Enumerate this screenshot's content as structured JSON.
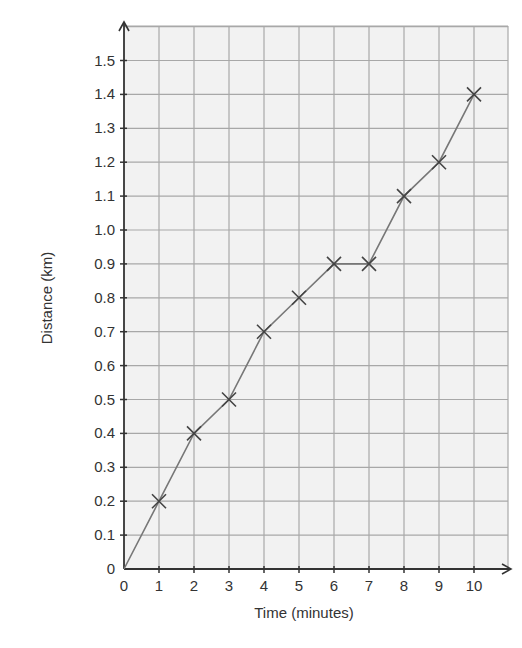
{
  "chart_data": {
    "type": "line",
    "title": "",
    "xlabel": "Time (minutes)",
    "ylabel": "Distance (km)",
    "x": [
      0,
      1,
      2,
      3,
      4,
      5,
      6,
      7,
      8,
      9,
      10
    ],
    "series": [
      {
        "name": "Distance",
        "values": [
          0,
          0.2,
          0.4,
          0.5,
          0.7,
          0.8,
          0.9,
          0.9,
          1.1,
          1.2,
          1.4
        ],
        "marker": "x",
        "marker_on_origin": false
      }
    ],
    "xticks": [
      "0",
      "1",
      "2",
      "3",
      "4",
      "5",
      "6",
      "7",
      "8",
      "9",
      "10"
    ],
    "yticks": [
      "0",
      "0.1",
      "0.2",
      "0.3",
      "0.4",
      "0.5",
      "0.6",
      "0.7",
      "0.8",
      "0.9",
      "1.0",
      "1.1",
      "1.2",
      "1.3",
      "1.4",
      "1.5"
    ],
    "xlim": [
      0,
      11
    ],
    "ylim": [
      0,
      1.6
    ],
    "grid": true,
    "legend": null
  },
  "colors": {
    "grid_background": "#f2f2f2",
    "grid_line": "#a8a8a8",
    "axis": "#333333",
    "series_line": "#777777",
    "marker": "#444444"
  }
}
